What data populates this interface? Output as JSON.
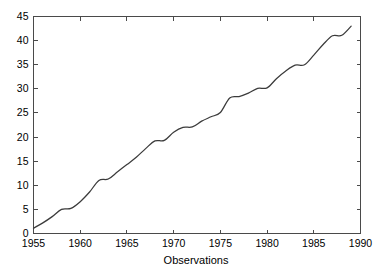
{
  "chart_data": {
    "type": "line",
    "title": "",
    "xlabel": "Observations",
    "ylabel": "",
    "xlim": [
      1955,
      1990
    ],
    "ylim": [
      0,
      45
    ],
    "grid": false,
    "legend": null,
    "x_ticks": [
      1955,
      1960,
      1965,
      1970,
      1975,
      1980,
      1985,
      1990
    ],
    "x_tick_labels": [
      "1955",
      "1960",
      "1965",
      "1970",
      "1975",
      "1980",
      "1985",
      "1990"
    ],
    "y_ticks": [
      0,
      5,
      10,
      15,
      20,
      25,
      30,
      35,
      40,
      45
    ],
    "y_tick_labels": [
      "0",
      "5",
      "10",
      "15",
      "20",
      "25",
      "30",
      "35",
      "40",
      "45"
    ],
    "line_color": "#3b3b3b",
    "series": [
      {
        "name": "cumulative observations",
        "x": [
          1955,
          1956,
          1957,
          1958,
          1959,
          1960,
          1961,
          1962,
          1963,
          1964,
          1965,
          1966,
          1967,
          1968,
          1969,
          1970,
          1971,
          1972,
          1973,
          1974,
          1975,
          1976,
          1977,
          1978,
          1979,
          1980,
          1981,
          1982,
          1983,
          1984,
          1985,
          1986,
          1987,
          1988,
          1989
        ],
        "values": [
          1.1,
          2.2,
          3.5,
          5.0,
          5.2,
          6.6,
          8.6,
          11.0,
          11.3,
          12.8,
          14.3,
          15.8,
          17.6,
          19.2,
          19.3,
          21.0,
          22.0,
          22.1,
          23.3,
          24.2,
          25.1,
          28.1,
          28.4,
          29.1,
          30.1,
          30.2,
          32.1,
          33.7,
          34.9,
          35.0,
          37.0,
          39.2,
          41.0,
          41.1,
          43.0
        ]
      }
    ]
  },
  "axis_titles": {
    "x": "Observations"
  }
}
